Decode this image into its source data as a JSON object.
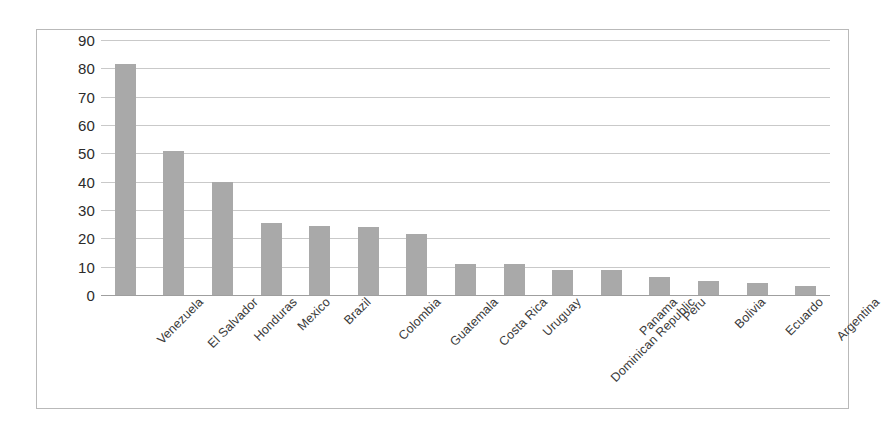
{
  "chart_data": {
    "type": "bar",
    "title": "",
    "subtitle": "",
    "xlabel": "",
    "ylabel": "",
    "ylim": [
      0,
      90
    ],
    "ytick_step": 10,
    "grid": true,
    "legend": false,
    "legend_position": "none",
    "bar_color": "#a9a9a9",
    "gridline_color": "#c9c9c9",
    "frame_color": "#b9b9b9",
    "text_color": "#2b2b2b",
    "yticks": [
      "90",
      "80",
      "70",
      "60",
      "50",
      "40",
      "30",
      "20",
      "10",
      "0"
    ],
    "categories": [
      "Venezuela",
      "El Salvador",
      "Honduras",
      "Mexico",
      "Brazil",
      "Colombia",
      "Guatemala",
      "Costa Rica",
      "Uruguay",
      "Dominican Republic",
      "Panama",
      "Peru",
      "Bolivia",
      "Ecuardo",
      "Argentina"
    ],
    "values": [
      81.5,
      51,
      40,
      25.5,
      24.5,
      24,
      21.5,
      11,
      11,
      9,
      8.7,
      6.5,
      5,
      4.3,
      3.3
    ]
  }
}
